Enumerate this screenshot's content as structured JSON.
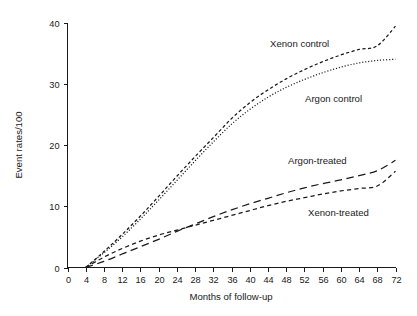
{
  "chart_data": {
    "type": "line",
    "title": "",
    "subtitle": "",
    "xlabel": "Months of follow-up",
    "ylabel": "Event rates/100",
    "xlim": [
      0,
      72
    ],
    "ylim": [
      0,
      40
    ],
    "grid": false,
    "legend_position": "inline-annotations",
    "xticks": [
      0,
      4,
      8,
      12,
      16,
      20,
      24,
      28,
      32,
      36,
      40,
      44,
      48,
      52,
      56,
      60,
      64,
      68,
      72
    ],
    "xtick_labels": [
      "0",
      "4",
      "8",
      "12",
      "16",
      "20",
      "24",
      "28",
      "32",
      "36",
      "40",
      "44",
      "48",
      "52",
      "56",
      "60",
      "64",
      "68",
      "72"
    ],
    "yticks": [
      0,
      10,
      20,
      30,
      40
    ],
    "ytick_labels": [
      "0",
      "10",
      "20",
      "30",
      "40"
    ],
    "x": [
      4,
      8,
      12,
      16,
      20,
      24,
      28,
      32,
      36,
      40,
      44,
      48,
      52,
      56,
      60,
      64,
      68,
      72
    ],
    "series": [
      {
        "name": "Xenon control",
        "style": "dotted-dashed",
        "color": "#1a1a1a",
        "values": [
          0,
          2.6,
          5.4,
          8.4,
          11.6,
          14.9,
          18.1,
          21.2,
          24.3,
          26.9,
          29.0,
          30.8,
          32.3,
          33.6,
          34.7,
          35.6,
          36.2,
          39.4
        ]
      },
      {
        "name": "Argon control",
        "style": "dotted",
        "color": "#1a1a1a",
        "values": [
          0,
          2.4,
          5.0,
          7.9,
          11.0,
          14.2,
          17.4,
          20.5,
          23.4,
          25.8,
          27.8,
          29.4,
          30.7,
          31.8,
          32.7,
          33.4,
          33.8,
          34.0
        ]
      },
      {
        "name": "Argon-treated",
        "style": "long-dash",
        "color": "#1a1a1a",
        "values": [
          0,
          1.0,
          2.2,
          3.4,
          4.6,
          5.9,
          7.1,
          8.3,
          9.4,
          10.4,
          11.3,
          12.2,
          13.0,
          13.7,
          14.3,
          15.0,
          15.8,
          17.5
        ]
      },
      {
        "name": "Xenon-treated",
        "style": "short-dash",
        "color": "#1a1a1a",
        "values": [
          0,
          1.7,
          3.1,
          4.3,
          5.3,
          6.1,
          6.9,
          7.7,
          8.5,
          9.3,
          10.1,
          10.8,
          11.4,
          12.0,
          12.5,
          12.9,
          13.3,
          15.7
        ]
      }
    ],
    "annotations": [
      {
        "text": "Xenon control",
        "x_month": 59,
        "y_value": 37.2
      },
      {
        "text": "Argon control",
        "x_month": 67,
        "y_value": 27.8
      },
      {
        "text": "Argon-treated",
        "x_month": 63,
        "y_value": 19.5
      },
      {
        "text": "Xenon-treated",
        "x_month": 70,
        "y_value": 11.5
      }
    ]
  },
  "axes": {
    "x_title": "Months of follow-up",
    "y_title": "Event rates/100"
  },
  "labels": {
    "xenon_control": "Xenon control",
    "argon_control": "Argon control",
    "argon_treated": "Argon-treated",
    "xenon_treated": "Xenon-treated"
  },
  "ticks": {
    "x": [
      "0",
      "4",
      "8",
      "12",
      "16",
      "20",
      "24",
      "28",
      "32",
      "36",
      "40",
      "44",
      "48",
      "52",
      "56",
      "60",
      "64",
      "68",
      "72"
    ],
    "y": [
      "0",
      "10",
      "20",
      "30",
      "40"
    ]
  },
  "colors": {
    "ink": "#1a1a1a",
    "background": "#ffffff"
  }
}
